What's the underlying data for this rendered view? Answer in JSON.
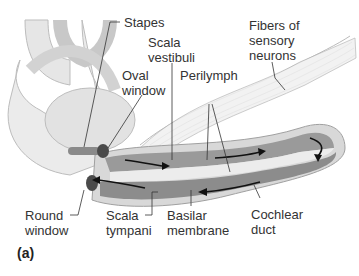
{
  "figure": {
    "panel_label": "(a)",
    "labels": {
      "stapes": "Stapes",
      "scala_vestibuli_1": "Scala",
      "scala_vestibuli_2": "vestibuli",
      "oval_window_1": "Oval",
      "oval_window_2": "window",
      "perilymph": "Perilymph",
      "fibers_1": "Fibers of",
      "fibers_2": "sensory",
      "fibers_3": "neurons",
      "round_window_1": "Round",
      "round_window_2": "window",
      "scala_tympani_1": "Scala",
      "scala_tympani_2": "tympani",
      "basilar_1": "Basilar",
      "basilar_2": "membrane",
      "cochlear_duct_1": "Cochlear",
      "cochlear_duct_2": "duct"
    },
    "colors": {
      "outer_wall": "#d6d6d6",
      "canal_dark": "#8a8a8a",
      "canal_mid": "#b0b0b0",
      "duct_light": "#e8e8e8",
      "leader_line": "#333333"
    }
  }
}
